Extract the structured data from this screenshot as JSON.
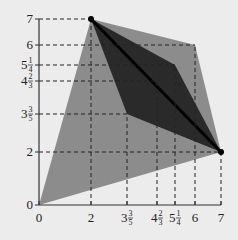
{
  "diagram": {
    "type": "feasible-region-plot",
    "axes": {
      "x_ticks": [
        {
          "label": "0",
          "whole": "0",
          "num": "",
          "den": "",
          "value": 0,
          "px": 39
        },
        {
          "label": "2",
          "whole": "2",
          "num": "",
          "den": "",
          "value": 2,
          "px": 91
        },
        {
          "label": "3 3/5",
          "whole": "3",
          "num": "3",
          "den": "5",
          "value": 3.6,
          "px": 127
        },
        {
          "label": "4 2/3",
          "whole": "4",
          "num": "2",
          "den": "3",
          "value": 4.667,
          "px": 157
        },
        {
          "label": "5 1/4",
          "whole": "5",
          "num": "1",
          "den": "4",
          "value": 5.25,
          "px": 175
        },
        {
          "label": "6",
          "whole": "6",
          "num": "",
          "den": "",
          "value": 6,
          "px": 195
        },
        {
          "label": "7",
          "whole": "7",
          "num": "",
          "den": "",
          "value": 7,
          "px": 221
        }
      ],
      "y_ticks": [
        {
          "label": "0",
          "whole": "0",
          "num": "",
          "den": "",
          "value": 0,
          "px": 205
        },
        {
          "label": "2",
          "whole": "2",
          "num": "",
          "den": "",
          "value": 2,
          "px": 152
        },
        {
          "label": "3 3/5",
          "whole": "3",
          "num": "3",
          "den": "5",
          "value": 3.6,
          "px": 114
        },
        {
          "label": "4 2/3",
          "whole": "4",
          "num": "2",
          "den": "3",
          "value": 4.667,
          "px": 81
        },
        {
          "label": "5 1/4",
          "whole": "5",
          "num": "1",
          "den": "4",
          "value": 5.25,
          "px": 65
        },
        {
          "label": "6",
          "whole": "6",
          "num": "",
          "den": "",
          "value": 6,
          "px": 45
        },
        {
          "label": "7",
          "whole": "7",
          "num": "",
          "den": "",
          "value": 7,
          "px": 19
        }
      ]
    },
    "regions": [
      {
        "name": "outer-light-region",
        "color": "#8c8c8c",
        "vertices": [
          [
            0,
            0
          ],
          [
            2,
            7
          ],
          [
            6,
            6
          ],
          [
            7,
            2
          ]
        ]
      },
      {
        "name": "inner-dark-region",
        "color": "#2a2a2a",
        "vertices": [
          [
            2,
            7
          ],
          [
            5.25,
            5.25
          ],
          [
            7,
            2
          ],
          [
            3.6,
            3.6
          ]
        ]
      }
    ],
    "diagonal": {
      "from": [
        2,
        7
      ],
      "to": [
        7,
        2
      ],
      "color": "#000000"
    },
    "points": [
      {
        "name": "point-2-7",
        "coords": [
          2,
          7
        ]
      },
      {
        "name": "point-7-2",
        "coords": [
          7,
          2
        ]
      }
    ],
    "guide_lines": [
      {
        "axis": "y",
        "value": 7,
        "to_x": 2
      },
      {
        "axis": "y",
        "value": 6,
        "to_x": 6
      },
      {
        "axis": "y",
        "value": 5.25,
        "to_x": 5.25
      },
      {
        "axis": "y",
        "value": 4.667,
        "to_x": 4.667
      },
      {
        "axis": "y",
        "value": 3.6,
        "to_x": 3.6
      },
      {
        "axis": "y",
        "value": 2,
        "to_x": 7
      },
      {
        "axis": "x",
        "value": 2,
        "to_y": 7
      },
      {
        "axis": "x",
        "value": 3.6,
        "to_y": 3.6
      },
      {
        "axis": "x",
        "value": 4.667,
        "to_y": 4.667
      },
      {
        "axis": "x",
        "value": 5.25,
        "to_y": 5.25
      },
      {
        "axis": "x",
        "value": 6,
        "to_y": 6
      },
      {
        "axis": "x",
        "value": 7,
        "to_y": 2
      }
    ],
    "colors": {
      "background": "#ececec",
      "light_region": "#8c8c8c",
      "dark_region": "#2a2a2a",
      "axis": "#333333",
      "dash": "#222222"
    }
  }
}
